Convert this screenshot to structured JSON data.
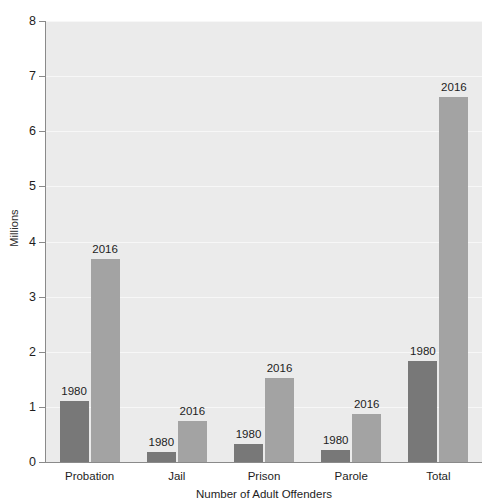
{
  "chart_data": {
    "type": "bar",
    "title": "",
    "subtitle": "",
    "xlabel": "Number of Adult Offenders",
    "ylabel": "Millions",
    "categories": [
      "Probation",
      "Jail",
      "Prison",
      "Parole",
      "Total"
    ],
    "series": [
      {
        "name": "1980",
        "color": "#787878",
        "values": [
          1.1,
          0.18,
          0.32,
          0.22,
          1.84
        ]
      },
      {
        "name": "2016",
        "color": "#a3a3a3",
        "values": [
          3.68,
          0.74,
          1.52,
          0.87,
          6.63
        ]
      }
    ],
    "point_labels": [
      [
        "1980",
        "1980",
        "1980",
        "1980",
        "1980"
      ],
      [
        "2016",
        "2016",
        "2016",
        "2016",
        "2016"
      ]
    ],
    "ylim": [
      0,
      8
    ],
    "yticks": [
      0,
      1,
      2,
      3,
      4,
      5,
      6,
      7,
      8
    ],
    "ytick_labels": [
      "0",
      "1",
      "2",
      "3",
      "4",
      "5",
      "6",
      "7",
      "8"
    ],
    "grid": true,
    "grid_axis": "y",
    "legend": false,
    "legend_position": "none",
    "plot_background": "#ebebeb",
    "gridline_color": "#f7f7f7",
    "axis_color": "#8a8a8a"
  }
}
